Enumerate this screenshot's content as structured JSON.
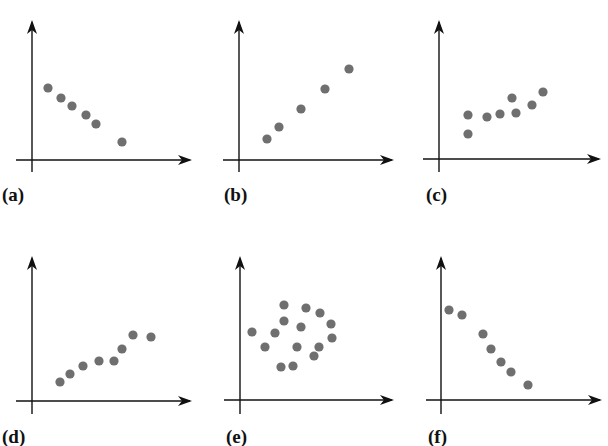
{
  "figure": {
    "width": 608,
    "height": 446,
    "dot_color": "#6f6f6f",
    "axis_color": "#111111",
    "dot_radius": 4.6
  },
  "chart_data": [
    {
      "type": "scatter",
      "label": "(a)",
      "trend": "negative linear",
      "axes": {
        "origin": [
          32,
          160
        ],
        "x_end": 190,
        "y_top": 22,
        "x_start": 16,
        "y_bottom": 172
      },
      "label_pos": [
        2,
        185
      ],
      "points": [
        [
          48,
          88
        ],
        [
          61,
          98
        ],
        [
          72,
          106
        ],
        [
          86,
          115
        ],
        [
          96,
          124
        ],
        [
          122,
          142
        ]
      ]
    },
    {
      "type": "scatter",
      "label": "(b)",
      "trend": "positive linear",
      "axes": {
        "origin": [
          239,
          160
        ],
        "x_end": 392,
        "y_top": 22,
        "x_start": 223,
        "y_bottom": 172
      },
      "label_pos": [
        224,
        185
      ],
      "points": [
        [
          267,
          139
        ],
        [
          279,
          127
        ],
        [
          301,
          109
        ],
        [
          325,
          89
        ],
        [
          349,
          69
        ]
      ]
    },
    {
      "type": "scatter",
      "label": "(c)",
      "trend": "weak positive",
      "axes": {
        "origin": [
          439,
          159
        ],
        "x_end": 599,
        "y_top": 22,
        "x_start": 423,
        "y_bottom": 172
      },
      "label_pos": [
        426,
        185
      ],
      "points": [
        [
          468,
          134
        ],
        [
          468,
          115
        ],
        [
          487,
          117
        ],
        [
          500,
          114
        ],
        [
          512,
          98
        ],
        [
          516,
          113
        ],
        [
          532,
          105
        ],
        [
          543,
          92
        ]
      ]
    },
    {
      "type": "scatter",
      "label": "(d)",
      "trend": "positive",
      "axes": {
        "origin": [
          32,
          401
        ],
        "x_end": 190,
        "y_top": 258,
        "x_start": 16,
        "y_bottom": 414
      },
      "label_pos": [
        2,
        427
      ],
      "points": [
        [
          60,
          382
        ],
        [
          70,
          374
        ],
        [
          83,
          366
        ],
        [
          99,
          361
        ],
        [
          114,
          361
        ],
        [
          122,
          349
        ],
        [
          133,
          335
        ],
        [
          151,
          337
        ]
      ]
    },
    {
      "type": "scatter",
      "label": "(e)",
      "trend": "no correlation",
      "axes": {
        "origin": [
          240,
          400
        ],
        "x_end": 392,
        "y_top": 258,
        "x_start": 224,
        "y_bottom": 414
      },
      "label_pos": [
        226,
        427
      ],
      "points": [
        [
          252,
          332
        ],
        [
          265,
          347
        ],
        [
          275,
          333
        ],
        [
          284,
          305
        ],
        [
          284,
          321
        ],
        [
          281,
          367
        ],
        [
          293,
          366
        ],
        [
          297,
          347
        ],
        [
          301,
          327
        ],
        [
          306,
          308
        ],
        [
          320,
          313
        ],
        [
          314,
          356
        ],
        [
          319,
          347
        ],
        [
          332,
          338
        ],
        [
          331,
          324
        ]
      ]
    },
    {
      "type": "scatter",
      "label": "(f)",
      "trend": "negative",
      "axes": {
        "origin": [
          441,
          400
        ],
        "x_end": 600,
        "y_top": 258,
        "x_start": 426,
        "y_bottom": 414
      },
      "label_pos": [
        428,
        427
      ],
      "points": [
        [
          449,
          310
        ],
        [
          462,
          315
        ],
        [
          483,
          334
        ],
        [
          491,
          349
        ],
        [
          501,
          362
        ],
        [
          511,
          372
        ],
        [
          528,
          385
        ]
      ]
    }
  ]
}
